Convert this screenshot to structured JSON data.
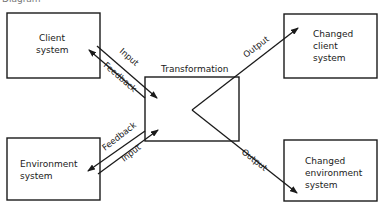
{
  "caption": "Diagram",
  "boxes": {
    "client": {
      "line1": "Client",
      "line2": "system"
    },
    "environment": {
      "line1": "Environment",
      "line2": "system"
    },
    "transformation": {
      "label": "Transformation"
    },
    "changed_client": {
      "line1": "Changed",
      "line2": "client",
      "line3": "system"
    },
    "changed_environment": {
      "line1": "Changed",
      "line2": "environment",
      "line3": "system"
    }
  },
  "arrows": {
    "client_input": "Input",
    "client_feedback": "Feedback",
    "env_feedback": "Feedback",
    "env_input": "Input",
    "output_top": "Output",
    "output_bottom": "Output"
  },
  "colors": {
    "stroke": "#1a1a1a",
    "background": "#ffffff"
  }
}
